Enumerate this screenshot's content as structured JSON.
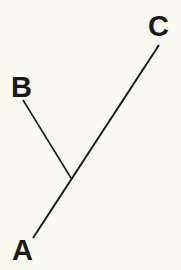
{
  "diagram": {
    "type": "cladogram",
    "labels": {
      "a": "A",
      "b": "B",
      "c": "C"
    },
    "edges": [
      {
        "from": "A",
        "to": "junction"
      },
      {
        "from": "junction",
        "to": "B"
      },
      {
        "from": "junction",
        "to": "C"
      }
    ],
    "colors": {
      "background": "#fbfaf2",
      "line": "#1a1a1a"
    }
  }
}
